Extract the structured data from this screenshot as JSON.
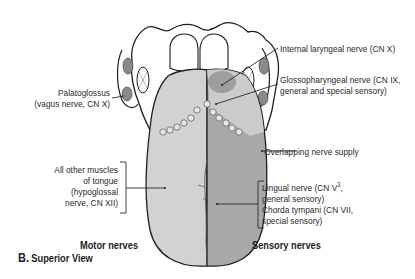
{
  "figure": {
    "caption_letter": "B.",
    "caption_title": "Superior View"
  },
  "colors": {
    "motor_region": "#d2d2d2",
    "sensory_region": "#a9a9a9",
    "internal_laryngeal_region": "#a0a0a0",
    "glossopharyngeal_region": "#c9c9c9",
    "outline": "#1e1e1e",
    "text": "#2a2a2a"
  },
  "labels": {
    "palatoglossus": {
      "line1": "Palatoglossus",
      "line2": "(vagus nerve, CN X)"
    },
    "internal_laryngeal": "Internal laryngeal nerve (CN X)",
    "glossopharyngeal": {
      "line1": "Glossopharyngeal nerve (CN IX,",
      "line2": "general and special sensory)"
    },
    "overlapping": "Overlapping nerve supply",
    "other_muscles": {
      "line1": "All other muscles",
      "line2": "of tongue",
      "line3": "(hypoglossal",
      "line4": "nerve, CN XII)"
    },
    "lingual": {
      "line1_pre": "Lingual nerve (CN V",
      "line1_sup": "3",
      "line1_post": ",",
      "line2": "general sensory)"
    },
    "chorda_tympani": {
      "line1": "Chorda tympani (CN VII,",
      "line2": "special sensory)"
    }
  },
  "group_titles": {
    "motor": "Motor nerves",
    "sensory": "Sensory nerves"
  }
}
